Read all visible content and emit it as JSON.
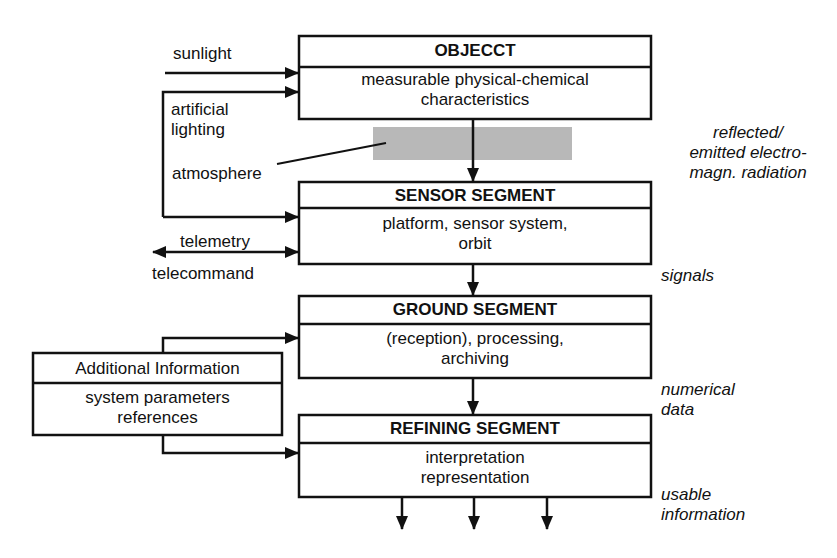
{
  "diagram": {
    "boxes": [
      {
        "id": "object",
        "title": "OBJECCT",
        "body_lines": [
          "measurable physical-chemical",
          "characteristics"
        ]
      },
      {
        "id": "sensor",
        "title": "SENSOR SEGMENT",
        "body_lines": [
          "platform, sensor system,",
          "orbit"
        ]
      },
      {
        "id": "ground",
        "title": "GROUND SEGMENT",
        "body_lines": [
          "(reception), processing,",
          "archiving"
        ]
      },
      {
        "id": "refining",
        "title": "REFINING SEGMENT",
        "body_lines": [
          "interpretation",
          "representation"
        ]
      },
      {
        "id": "additional",
        "title": "Additional Information",
        "body_lines": [
          "system parameters",
          "references"
        ]
      }
    ],
    "inputs": {
      "sunlight": "sunlight",
      "artificial_lighting": [
        "artificial",
        "lighting"
      ],
      "atmosphere": "atmosphere",
      "telemetry": "telemetry",
      "telecommand": "telecommand"
    },
    "flow_labels": {
      "radiation": [
        "reflected/",
        "emitted electro-",
        "magn. radiation"
      ],
      "signals": "signals",
      "numerical_data": [
        "numerical",
        "data"
      ],
      "usable_information": [
        "usable",
        "information"
      ]
    },
    "colors": {
      "line": "#111111",
      "atmosphere_band": "#b8b8b8",
      "background": "#ffffff"
    }
  }
}
